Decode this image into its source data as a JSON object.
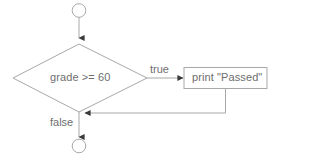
{
  "diagram": {
    "type": "flowchart",
    "background_color": "#ffffff",
    "line_color": "#a8a8a8",
    "arrow_color": "#3a3a3a",
    "text_color": "#6e6e6e",
    "nodes": [
      {
        "id": "start",
        "shape": "circle",
        "name": "start-connector",
        "label": ""
      },
      {
        "id": "decision",
        "shape": "diamond",
        "name": "decision-node",
        "label": "grade >= 60"
      },
      {
        "id": "process",
        "shape": "rectangle",
        "name": "process-node",
        "label": "print \"Passed\""
      },
      {
        "id": "end",
        "shape": "circle",
        "name": "end-connector",
        "label": ""
      }
    ],
    "edges": [
      {
        "id": "start-to-decision",
        "from": "start",
        "to": "decision",
        "label": ""
      },
      {
        "id": "decision-to-process",
        "from": "decision",
        "to": "process",
        "label": "true"
      },
      {
        "id": "process-to-merge",
        "from": "process",
        "to": "merge",
        "label": ""
      },
      {
        "id": "decision-to-end",
        "from": "decision",
        "to": "end",
        "label": "false"
      }
    ]
  }
}
